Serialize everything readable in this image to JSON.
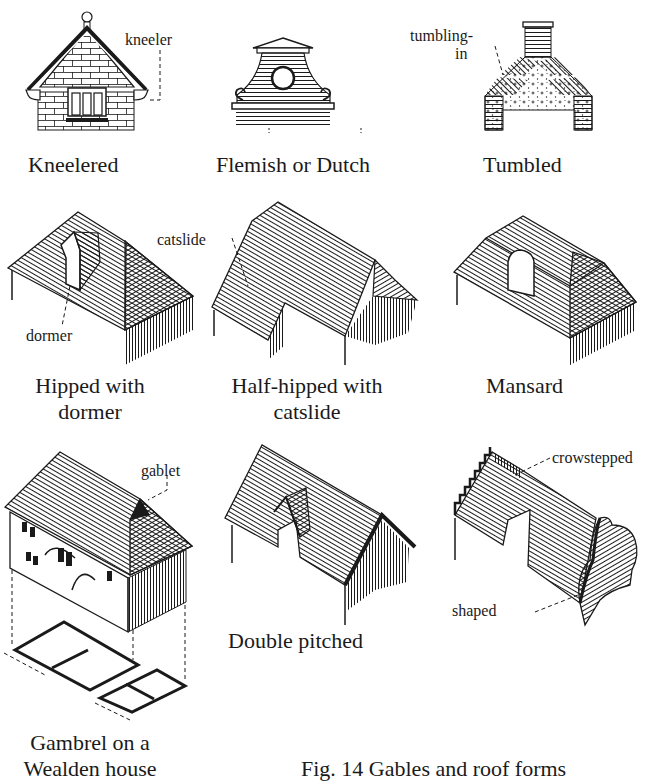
{
  "figure": {
    "caption": "Fig. 14   Gables and roof forms",
    "ink_color": "#1a1a1a",
    "paper_color": "#ffffff"
  },
  "panels": [
    {
      "id": "kneelered",
      "caption": "Kneelered",
      "annotations": [
        "kneeler"
      ]
    },
    {
      "id": "flemish",
      "caption": "Flemish or Dutch",
      "annotations": []
    },
    {
      "id": "tumbled",
      "caption": "Tumbled",
      "annotations": [
        "tumbling-",
        "in"
      ]
    },
    {
      "id": "hipped",
      "caption_lines": [
        "Hipped with",
        "dormer"
      ],
      "annotations": [
        "dormer"
      ]
    },
    {
      "id": "half-hipped",
      "caption_lines": [
        "Half-hipped with",
        "catslide"
      ],
      "annotations": [
        "catslide"
      ]
    },
    {
      "id": "mansard",
      "caption": "Mansard",
      "annotations": []
    },
    {
      "id": "gambrel",
      "caption_lines": [
        "Gambrel on a",
        "Wealden house"
      ],
      "annotations": [
        "gablet"
      ]
    },
    {
      "id": "double-pitched",
      "caption": "Double pitched",
      "annotations": []
    },
    {
      "id": "crowstepped-shaped",
      "caption": "",
      "annotations": [
        "crowstepped",
        "shaped"
      ]
    }
  ]
}
